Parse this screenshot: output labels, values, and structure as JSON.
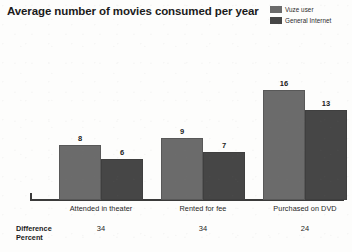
{
  "chart_data": {
    "type": "bar",
    "title": "Average number of movies consumed per year",
    "xlabel": "",
    "ylabel": "",
    "categories": [
      "Attended in theater",
      "Rented for fee",
      "Purchased on DVD"
    ],
    "series": [
      {
        "name": "Vuze user",
        "values": [
          8,
          9,
          16
        ],
        "color": "#6b6b6b"
      },
      {
        "name": "General Internet",
        "values": [
          6,
          7,
          13
        ],
        "color": "#464646"
      }
    ],
    "ylim": [
      0,
      17
    ],
    "grid": false,
    "legend_position": "top-right",
    "annotations": {
      "difference_label_line1": "Difference",
      "difference_label_line2": "Percent",
      "difference_values": [
        "34",
        "34",
        "24"
      ]
    }
  },
  "legend": {
    "items": [
      {
        "label": "Vuze user",
        "color": "#6b6b6b"
      },
      {
        "label": "General Internet",
        "color": "#464646"
      }
    ]
  },
  "groups": [
    {
      "category": "Attended in theater",
      "difference": "34",
      "bars": [
        {
          "series": "Vuze user",
          "value": "8"
        },
        {
          "series": "General Internet",
          "value": "6"
        }
      ]
    },
    {
      "category": "Rented for fee",
      "difference": "34",
      "bars": [
        {
          "series": "Vuze user",
          "value": "9"
        },
        {
          "series": "General Internet",
          "value": "7"
        }
      ]
    },
    {
      "category": "Purchased on DVD",
      "difference": "24",
      "bars": [
        {
          "series": "Vuze user",
          "value": "16"
        },
        {
          "series": "General Internet",
          "value": "13"
        }
      ]
    }
  ],
  "footer": {
    "difference_line1": "Difference",
    "difference_line2": "Percent"
  }
}
